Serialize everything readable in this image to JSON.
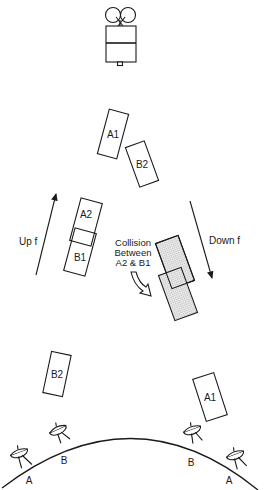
{
  "diagram": {
    "type": "satellite-uplink-downlink-frequency-collision",
    "satellite": {
      "name": "satellite"
    },
    "uplink_label": "Up f",
    "downlink_label": "Down f",
    "collision_note": {
      "line1": "Collision",
      "line2": "Between",
      "line3": "A2 & B1"
    },
    "carriers_top": [
      {
        "label": "A1"
      },
      {
        "label": "B2"
      }
    ],
    "carriers_uplink": [
      {
        "label": "A2"
      },
      {
        "label": "B1"
      }
    ],
    "carriers_ground": [
      {
        "label": "B2"
      },
      {
        "label": "A1"
      }
    ],
    "earth_stations": [
      {
        "label": "A"
      },
      {
        "label": "B"
      },
      {
        "label": "B"
      },
      {
        "label": "A"
      }
    ],
    "colors": {
      "line": "#1a1a1a",
      "background": "#ffffff",
      "hatch": "#bdbdbd"
    }
  }
}
